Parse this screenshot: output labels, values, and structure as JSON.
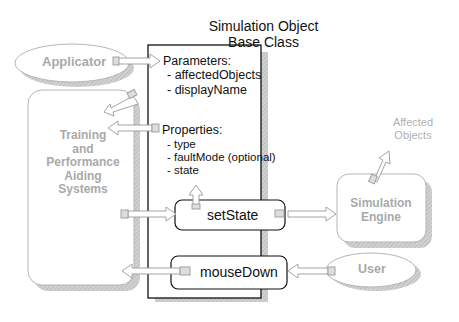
{
  "diagram": {
    "title_line1": "Simulation Object",
    "title_line2": "Base Class",
    "parameters": {
      "header": "Parameters:",
      "items": [
        "- affectedObjects",
        "- displayName"
      ]
    },
    "properties": {
      "header": "Properties:",
      "items": [
        "- type",
        "- faultMode (optional)",
        "-  state"
      ]
    },
    "methods": {
      "set_state": "setState",
      "mouse_down": "mouseDown"
    },
    "external": {
      "applicator": "Applicator",
      "training_lines": [
        "Training",
        "and",
        "Performance",
        "Aiding",
        "Systems"
      ],
      "simulation_engine_lines": [
        "Simulation",
        "Engine"
      ],
      "affected_objects_lines": [
        "Affected",
        "Objects"
      ],
      "user": "User"
    },
    "colors": {
      "outline_gray": "#b0b0b0",
      "text_gray": "#a9a9a9",
      "shadow": "#c8c8c8",
      "ink": "#111111"
    }
  }
}
